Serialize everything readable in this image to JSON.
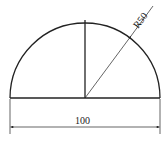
{
  "diagram": {
    "shape": "semicircle",
    "radius_label": "R50",
    "diameter_label": "100",
    "stroke_color": "#222222",
    "background": "#ffffff"
  }
}
